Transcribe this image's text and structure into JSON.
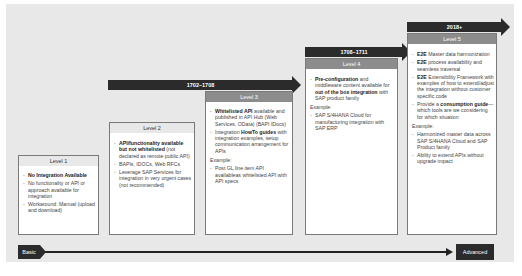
{
  "timeline": {
    "start_label": "Basic",
    "end_label": "Advanced"
  },
  "release_bars": [
    {
      "label": "1702–1708"
    },
    {
      "label": "1708–1711"
    },
    {
      "label": "2018+"
    }
  ],
  "levels": [
    {
      "title": "Level 1",
      "bullets": [
        {
          "bold": "No Integration Available",
          "rest": ""
        },
        {
          "bold": "",
          "rest": "No functionality or API or approach available for integration"
        },
        {
          "bold": "",
          "rest": "Workaround: Manual (upload and download)"
        }
      ]
    },
    {
      "title": "Level 2",
      "bullets": [
        {
          "bold": "API/functionality available but not whitelisted",
          "rest": " (not declared as remote public API)"
        },
        {
          "bold": "",
          "rest": "BAPIs, IDOCs, Web RFCs"
        },
        {
          "bold": "",
          "rest": "Leverage SAP Services for integration in very urgent cases (not recommended)"
        }
      ]
    },
    {
      "title": "Level 3",
      "bullets": [
        {
          "bold": "Whitelisted API",
          "rest": " available and published in API Hub (Web Services, OData) (BAPI IDocs)"
        },
        {
          "pre": "Integration ",
          "bold": "HowTo guides",
          "rest": " with integration examples, setup communication arrangement for APIs"
        }
      ],
      "example_label": "Example:",
      "examples": [
        "Post GL line item API availableas whitelisted API with API specs"
      ]
    },
    {
      "title": "Level 4",
      "bullets": [
        {
          "bold": "Pre-configuration",
          "rest": " and middleware content available for ",
          "bold2": "out of the box integration",
          "rest2": " with SAP product family"
        }
      ],
      "example_label": "Example:",
      "examples": [
        "SAP S/4HANA Cloud for manufacturing integration with SAP ERP"
      ]
    },
    {
      "title": "Level 5",
      "bullets": [
        {
          "bold": "E2E",
          "rest": " Master data harmonization"
        },
        {
          "bold": "E2E",
          "rest": " process availability and seamless traversal"
        },
        {
          "bold": "E2E",
          "rest": " Extensibility Framework with examples of how to extend/adjust the integration without customer specific code"
        },
        {
          "pre": "Provide a ",
          "bold": "consumption guide",
          "rest": "—which tools are we considering for which situation"
        }
      ],
      "example_label": "Example:",
      "examples": [
        "Harmonized master data across SAP S/4HANA Cloud and SAP Product family",
        "Ability to extend APIs without upgrade impact"
      ]
    }
  ]
}
